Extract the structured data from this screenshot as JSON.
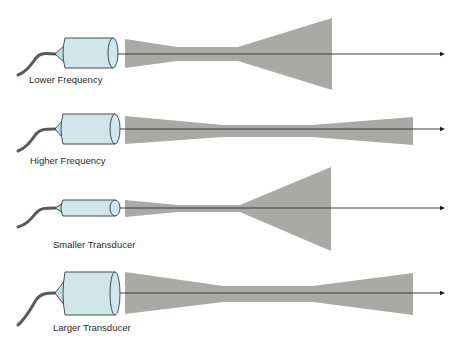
{
  "diagram": {
    "topic": "Ultrasound beam focusing vs. frequency and transducer size",
    "colors": {
      "beam": "#a9aaa6",
      "transducer_body": "#cfe6ea",
      "outline": "#2f3d42",
      "cable": "#5a5a58",
      "axis": "#2b2b2b"
    },
    "panels": [
      {
        "id": "lower-frequency",
        "label": "Lower Frequency",
        "transducer": "standard",
        "near_zone": "short",
        "divergence": "wide"
      },
      {
        "id": "higher-frequency",
        "label": "Higher Frequency",
        "transducer": "standard",
        "near_zone": "long",
        "divergence": "narrow"
      },
      {
        "id": "smaller-transducer",
        "label": "Smaller Transducer",
        "transducer": "small",
        "near_zone": "short",
        "divergence": "wide"
      },
      {
        "id": "larger-transducer",
        "label": "Larger Transducer",
        "transducer": "large",
        "near_zone": "long",
        "divergence": "narrow"
      }
    ]
  }
}
